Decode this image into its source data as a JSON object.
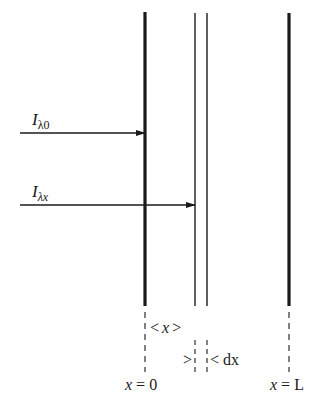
{
  "diagram": {
    "type": "radiation-attenuation-slab",
    "colors": {
      "ink": "#1a1a1a",
      "background": "#ffffff"
    },
    "boundaries": [
      {
        "id": "left-boundary",
        "x": 145,
        "style": "thick",
        "label": "x = 0"
      },
      {
        "id": "slice-left",
        "x": 195,
        "style": "thin"
      },
      {
        "id": "slice-right",
        "x": 207,
        "style": "thin"
      },
      {
        "id": "right-boundary",
        "x": 289,
        "style": "thick",
        "label": "x = L"
      }
    ],
    "arrows": [
      {
        "id": "incident-intensity",
        "label_main": "I",
        "label_sub": "λ0",
        "y": 133,
        "x_start": 20,
        "x_end": 145
      },
      {
        "id": "intensity-at-x",
        "label_main": "I",
        "label_sub": "λx",
        "y": 205,
        "x_start": 20,
        "x_end": 195
      }
    ],
    "dimensions": {
      "x_span": {
        "text_open": "<",
        "text_var": "x",
        "text_close": ">"
      },
      "dx_span": {
        "text_left": ">",
        "text_right": "<",
        "text_var": "dx"
      }
    },
    "axis_labels": {
      "origin": {
        "var": "x",
        "eq": "= 0"
      },
      "end": {
        "var": "x",
        "eq": "= L"
      }
    }
  }
}
